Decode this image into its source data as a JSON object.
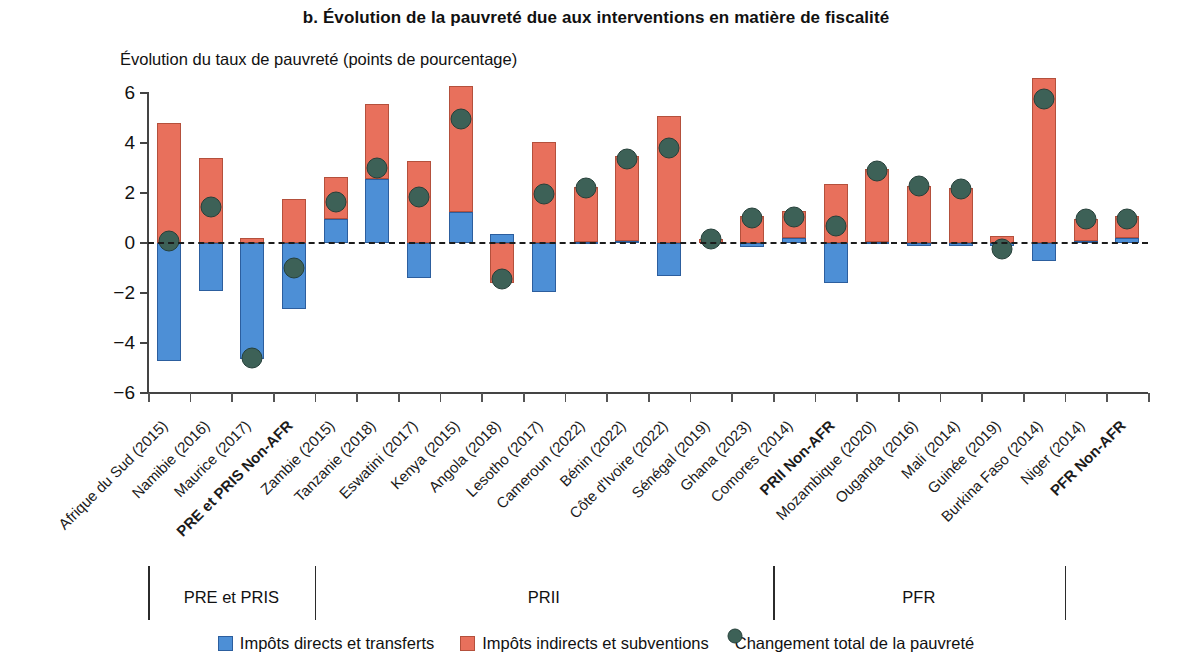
{
  "figure": {
    "panel_title": "b. Évolution de la pauvreté due aux interventions en matière de fiscalité",
    "axis_title": "Évolution du taux de pauvreté (points de pourcentage)"
  },
  "legend": {
    "items": [
      {
        "key": "direct",
        "label": "Impôts directs et transferts",
        "color": "#4d8fd6",
        "marker": "square"
      },
      {
        "key": "indirect",
        "label": "Impôts indirects et subventions",
        "color": "#e8705c",
        "marker": "square"
      },
      {
        "key": "total",
        "label": "Changement total de la pauvreté",
        "color": "#3d6157",
        "marker": "circle"
      }
    ]
  },
  "groups": [
    {
      "label": "PRE et PRIS",
      "start": 0,
      "end": 3
    },
    {
      "label": "PRII",
      "start": 4,
      "end": 14
    },
    {
      "label": "PFR",
      "start": 15,
      "end": 21
    }
  ],
  "chart_data": {
    "type": "bar",
    "title": "b. Évolution de la pauvreté due aux interventions en matière de fiscalité",
    "subtitle": "Évolution du taux de pauvreté (points de pourcentage)",
    "xlabel": "",
    "ylabel": "Évolution du taux de pauvreté (points de pourcentage)",
    "ylim": [
      -6,
      6
    ],
    "yticks": [
      6,
      4,
      2,
      0,
      -2,
      -4,
      -6
    ],
    "grid": false,
    "legend_position": "bottom",
    "stacked": true,
    "zero_reference_line": true,
    "categories": [
      "Afrique du Sud (2015)",
      "Namibie (2016)",
      "Maurice (2017)",
      "PRE et PRIS Non-AFR",
      "Zambie (2015)",
      "Tanzanie (2018)",
      "Eswatini (2017)",
      "Kenya (2015)",
      "Angola (2018)",
      "Lesotho (2017)",
      "Cameroun (2022)",
      "Bénin (2022)",
      "Côte d'Ivoire (2022)",
      "Sénégal (2019)",
      "Ghana (2023)",
      "Comores (2014)",
      "PRII Non-AFR",
      "Mozambique (2020)",
      "Ouganda (2016)",
      "Mali (2014)",
      "Guinée (2019)",
      "Burkina Faso (2014)",
      "Niger (2014)",
      "PFR Non-AFR"
    ],
    "bold_categories": [
      "PRE et PRIS Non-AFR",
      "PRII Non-AFR",
      "PFR Non-AFR"
    ],
    "series": [
      {
        "name": "Impôts directs et transferts",
        "color": "#4d8fd6",
        "values": [
          -4.7,
          -1.9,
          -4.65,
          -2.65,
          0.95,
          2.55,
          -1.4,
          1.25,
          0.35,
          -1.95,
          0.06,
          0.08,
          -1.3,
          0.0,
          -0.15,
          0.22,
          -1.6,
          0.05,
          -0.1,
          -0.1,
          -0.12,
          -0.7,
          0.07,
          0.2
        ]
      },
      {
        "name": "Impôts indirects et subventions",
        "color": "#e8705c",
        "values": [
          4.8,
          3.4,
          0.2,
          1.75,
          1.7,
          3.0,
          3.3,
          5.05,
          -1.6,
          4.05,
          2.2,
          3.4,
          5.1,
          0.18,
          1.1,
          1.05,
          2.35,
          2.9,
          2.3,
          2.2,
          0.3,
          6.6,
          0.9,
          0.9
        ]
      }
    ],
    "total_points": {
      "name": "Changement total de la pauvreté",
      "color": "#3d6157",
      "values": [
        0.1,
        1.45,
        -4.6,
        -1.0,
        1.65,
        3.0,
        1.85,
        4.95,
        -1.45,
        1.95,
        2.2,
        3.35,
        3.8,
        0.18,
        1.0,
        1.05,
        0.7,
        2.9,
        2.3,
        2.15,
        -0.22,
        5.75,
        0.95,
        0.95
      ]
    }
  }
}
